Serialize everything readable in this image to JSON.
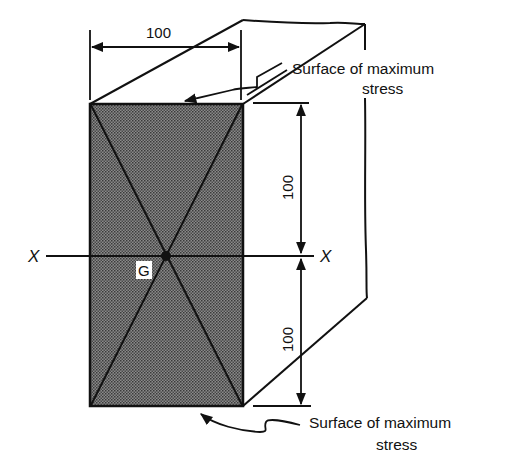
{
  "diagram": {
    "type": "isometric beam cross-section",
    "dimensions": {
      "width_label": "100",
      "upper_height_label": "100",
      "lower_height_label": "100"
    },
    "axis": {
      "left_label": "X",
      "right_label": "X"
    },
    "centroid_label": "G",
    "annotations": {
      "top": {
        "line1": "Surface of maximum",
        "line2": "stress"
      },
      "bottom": {
        "line1": "Surface of maximum",
        "line2": "stress"
      }
    },
    "colors": {
      "line": "#111111",
      "fill": "#6e6e6e",
      "background": "#ffffff"
    }
  }
}
